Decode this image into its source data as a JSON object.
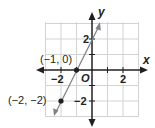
{
  "graph": {
    "x_axis_label": "x",
    "y_axis_label": "y",
    "origin_label": "O",
    "x_ticks": [
      "−2",
      "2"
    ],
    "y_ticks": [
      "2",
      "−2"
    ],
    "grid_range": {
      "x": [
        -3,
        3
      ],
      "y": [
        -3,
        3
      ]
    },
    "points": [
      {
        "label": "(−1, 0)",
        "x": -1,
        "y": 0
      },
      {
        "label": "(−2, −2)",
        "x": -2,
        "y": -2
      }
    ],
    "line": {
      "equation": "y = 2x + 2",
      "slope": 2,
      "intercept": 2,
      "color": "#808285"
    },
    "colors": {
      "grid": "#d1d3d4",
      "axis": "#231f20",
      "point": "#231f20"
    }
  }
}
